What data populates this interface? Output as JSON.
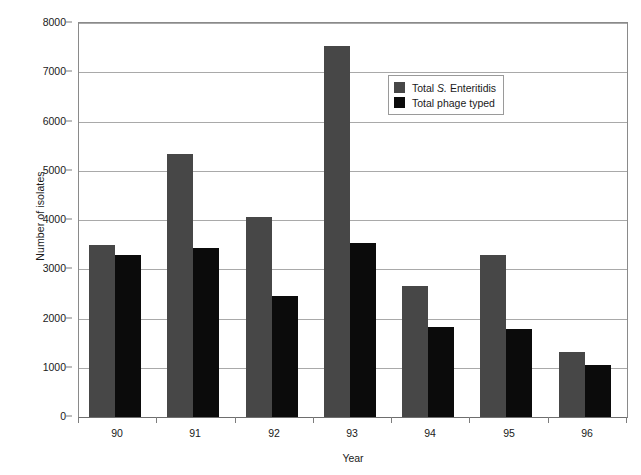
{
  "chart_data": {
    "type": "bar",
    "title": "",
    "xlabel": "Year",
    "ylabel": "Number of isolates",
    "categories": [
      "90",
      "91",
      "92",
      "93",
      "94",
      "95",
      "96"
    ],
    "series": [
      {
        "name": "Total S. Enteritidis",
        "color": "#474747",
        "values": [
          3490,
          5350,
          4060,
          7530,
          2670,
          3280,
          1320
        ]
      },
      {
        "name": "Total phage typed",
        "color": "#0b0b0b",
        "values": [
          3280,
          3430,
          2460,
          3540,
          1830,
          1780,
          1060
        ]
      }
    ],
    "ylim": [
      0,
      8000
    ],
    "yticks": [
      0,
      1000,
      2000,
      3000,
      4000,
      5000,
      6000,
      7000,
      8000
    ],
    "ytick_labels": [
      "0",
      "1000",
      "2000",
      "3000",
      "4000",
      "5000",
      "6000",
      "7000",
      "8000"
    ],
    "grid": true,
    "grid_axis": "y",
    "legend_position": "upper right inside",
    "legend_entries": [
      {
        "prefix": "Total ",
        "italic": "S.",
        "suffix": " Enteritidis",
        "swatch": "series-a"
      },
      {
        "prefix": "Total phage typed",
        "italic": "",
        "suffix": "",
        "swatch": "series-b"
      }
    ]
  }
}
